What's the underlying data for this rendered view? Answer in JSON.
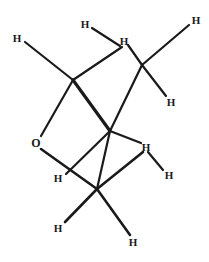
{
  "figure": {
    "kind": "chemical-structure-diagram",
    "width": 209,
    "height": 262,
    "background_color": "#ffffff",
    "line_color": "#1a1a1a"
  },
  "atoms": [
    {
      "id": "h-top-left",
      "element": "H",
      "x": 17,
      "y": 38
    },
    {
      "id": "h-top-upper",
      "element": "H",
      "x": 85,
      "y": 24
    },
    {
      "id": "h-top-center",
      "element": "H",
      "x": 124,
      "y": 41
    },
    {
      "id": "h-top-right",
      "element": "H",
      "x": 196,
      "y": 20
    },
    {
      "id": "h-right-upper",
      "element": "H",
      "x": 171,
      "y": 102
    },
    {
      "id": "o-ring",
      "element": "O",
      "x": 36,
      "y": 143
    },
    {
      "id": "h-mid-right",
      "element": "H",
      "x": 146,
      "y": 147
    },
    {
      "id": "h-left-lower",
      "element": "H",
      "x": 58,
      "y": 178
    },
    {
      "id": "h-right-lower",
      "element": "H",
      "x": 169,
      "y": 175
    },
    {
      "id": "h-bottom-left",
      "element": "H",
      "x": 58,
      "y": 228
    },
    {
      "id": "h-bottom-center",
      "element": "H",
      "x": 133,
      "y": 242
    }
  ],
  "vertices": [
    {
      "id": "c-top-left",
      "x": 73,
      "y": 80
    },
    {
      "id": "c-top-right",
      "x": 142,
      "y": 65
    },
    {
      "id": "c-center",
      "x": 110,
      "y": 131
    },
    {
      "id": "c-bottom",
      "x": 97,
      "y": 189
    },
    {
      "id": "o-vertex",
      "x": 41,
      "y": 136
    }
  ],
  "bonds": [
    {
      "id": "bond-h-top-left",
      "x1": 25,
      "y1": 42,
      "x2": 73,
      "y2": 80,
      "width": 2.2
    },
    {
      "id": "bond-h-top-upper",
      "x1": 92,
      "y1": 28,
      "x2": 120,
      "y2": 46,
      "width": 2.2
    },
    {
      "id": "bond-topleft-topctr",
      "x1": 73,
      "y1": 80,
      "x2": 122,
      "y2": 47,
      "width": 2.2
    },
    {
      "id": "bond-topctr-topright",
      "x1": 128,
      "y1": 45,
      "x2": 142,
      "y2": 65,
      "width": 2.2
    },
    {
      "id": "bond-h-top-right",
      "x1": 142,
      "y1": 65,
      "x2": 189,
      "y2": 25,
      "width": 2.2
    },
    {
      "id": "bond-h-right-upper",
      "x1": 142,
      "y1": 65,
      "x2": 166,
      "y2": 96,
      "width": 2.2
    },
    {
      "id": "bond-topright-center",
      "x1": 142,
      "y1": 65,
      "x2": 110,
      "y2": 131,
      "width": 2.2
    },
    {
      "id": "bond-topleft-center",
      "x1": 73,
      "y1": 80,
      "x2": 110,
      "y2": 131,
      "width": 3.2
    },
    {
      "id": "bond-topleft-oxygen",
      "x1": 73,
      "y1": 80,
      "x2": 41,
      "y2": 136,
      "width": 2.2
    },
    {
      "id": "bond-oxygen-bottom",
      "x1": 41,
      "y1": 149,
      "x2": 97,
      "y2": 189,
      "width": 2.6
    },
    {
      "id": "bond-center-bottom",
      "x1": 110,
      "y1": 131,
      "x2": 66,
      "y2": 174,
      "width": 2.2
    },
    {
      "id": "bond-center-hmid",
      "x1": 110,
      "y1": 131,
      "x2": 141,
      "y2": 143,
      "width": 2.2
    },
    {
      "id": "bond-hmid-hlower",
      "x1": 148,
      "y1": 152,
      "x2": 163,
      "y2": 170,
      "width": 2.2
    },
    {
      "id": "bond-center-bottomv",
      "x1": 110,
      "y1": 131,
      "x2": 97,
      "y2": 189,
      "width": 2.2
    },
    {
      "id": "bond-bottom-hleft",
      "x1": 97,
      "y1": 189,
      "x2": 65,
      "y2": 222,
      "width": 2.6
    },
    {
      "id": "bond-bottom-hcenter",
      "x1": 97,
      "y1": 189,
      "x2": 130,
      "y2": 235,
      "width": 2.6
    },
    {
      "id": "bond-bottom-right",
      "x1": 97,
      "y1": 189,
      "x2": 143,
      "y2": 152,
      "width": 2.6
    }
  ]
}
